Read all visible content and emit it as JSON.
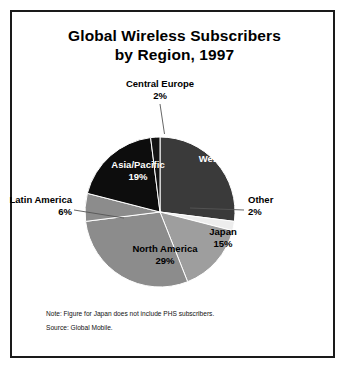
{
  "figure": {
    "title_line1": "Global Wireless Subscribers",
    "title_line2": "by Region, 1997",
    "note": "Note: Figure for Japan does not include PHS subscribers.",
    "source": "Source: Global Mobile."
  },
  "chart_data": {
    "type": "pie",
    "title": "Global Wireless Subscribers by Region, 1997",
    "subtitle": "",
    "xlabel": "",
    "ylabel": "",
    "unit": "percent",
    "start_angle_deg": 0,
    "direction": "clockwise",
    "legend": "none-labels-on-slices",
    "grid": false,
    "categories": [
      "Western Europe",
      "Other",
      "Japan",
      "North America",
      "Latin America",
      "Asia/Pacific",
      "Central Europe"
    ],
    "values": [
      27,
      2,
      15,
      29,
      6,
      19,
      2
    ],
    "labels": [
      "27%",
      "2%",
      "15%",
      "29%",
      "6%",
      "19%",
      "2%"
    ],
    "colors": [
      "#3a3a3a",
      "#ededed",
      "#9e9e9e",
      "#8c8c8c",
      "#8c8c8c",
      "#0d0d0d",
      "#141414"
    ],
    "slices": [
      {
        "name": "Western Europe",
        "value": 27,
        "label": "27%",
        "color": "#3a3a3a",
        "label_placement": "inside",
        "label_color": "#ffffff"
      },
      {
        "name": "Other",
        "value": 2,
        "label": "2%",
        "color": "#ededed",
        "label_placement": "outside",
        "label_color": "#000000"
      },
      {
        "name": "Japan",
        "value": 15,
        "label": "15%",
        "color": "#9e9e9e",
        "label_placement": "inside",
        "label_color": "#000000"
      },
      {
        "name": "North America",
        "value": 29,
        "label": "29%",
        "color": "#8c8c8c",
        "label_placement": "inside",
        "label_color": "#000000"
      },
      {
        "name": "Latin America",
        "value": 6,
        "label": "6%",
        "color": "#8c8c8c",
        "label_placement": "outside",
        "label_color": "#000000"
      },
      {
        "name": "Asia/Pacific",
        "value": 19,
        "label": "19%",
        "color": "#0d0d0d",
        "label_placement": "inside",
        "label_color": "#ffffff"
      },
      {
        "name": "Central Europe",
        "value": 2,
        "label": "2%",
        "color": "#141414",
        "label_placement": "outside",
        "label_color": "#000000"
      }
    ]
  },
  "style": {
    "frame_color": "#1a1a1a",
    "background": "#ffffff",
    "slice_separator": "#ffffff",
    "leader_line": "#555555"
  }
}
